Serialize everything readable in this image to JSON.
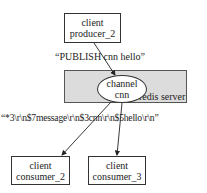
{
  "producer": {
    "line1": "client",
    "line2": "producer_2"
  },
  "publish_command": "“PUBLISH cnn hello”",
  "server": {
    "label": "redis server",
    "fill": "#dcdcdc"
  },
  "channel": {
    "line1": "channel",
    "line2": "cnn"
  },
  "message_payload": "“*3\\r\\n$7message\\r\\n$3cnn\\r\\n$5hello\\r\\n”",
  "consumers": [
    {
      "line1": "client",
      "line2": "consumer_2"
    },
    {
      "line1": "client",
      "line2": "consumer_3"
    }
  ]
}
